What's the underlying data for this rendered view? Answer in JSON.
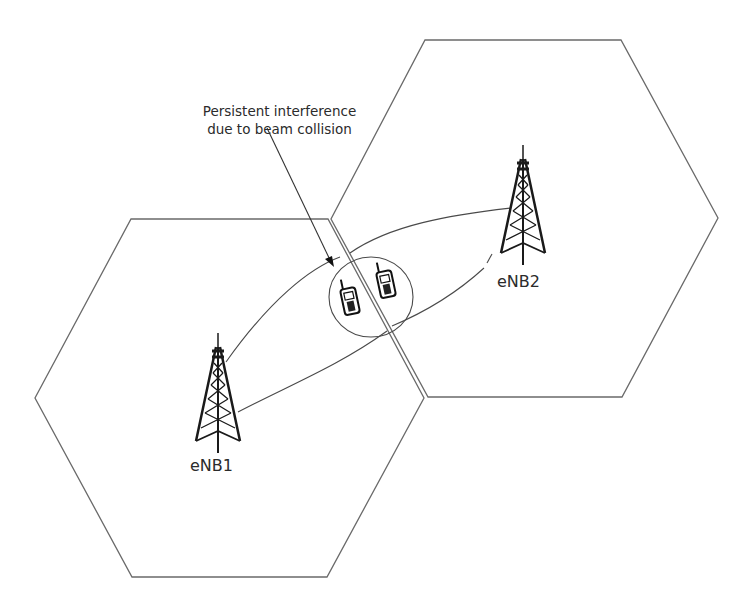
{
  "diagram": {
    "callout": {
      "line1": "Persistent interference",
      "line2": "due to beam collision"
    },
    "cells": [
      {
        "id": "cell-1",
        "station_label": "eNB1",
        "icon": "cell-tower-icon"
      },
      {
        "id": "cell-2",
        "station_label": "eNB2",
        "icon": "cell-tower-icon"
      }
    ],
    "devices": [
      {
        "icon": "mobile-phone-icon"
      },
      {
        "icon": "mobile-phone-icon"
      }
    ],
    "colors": {
      "line": "#5a5a5a",
      "tower": "#1a1a1a",
      "text": "#2b2b2b",
      "background": "#ffffff"
    }
  }
}
